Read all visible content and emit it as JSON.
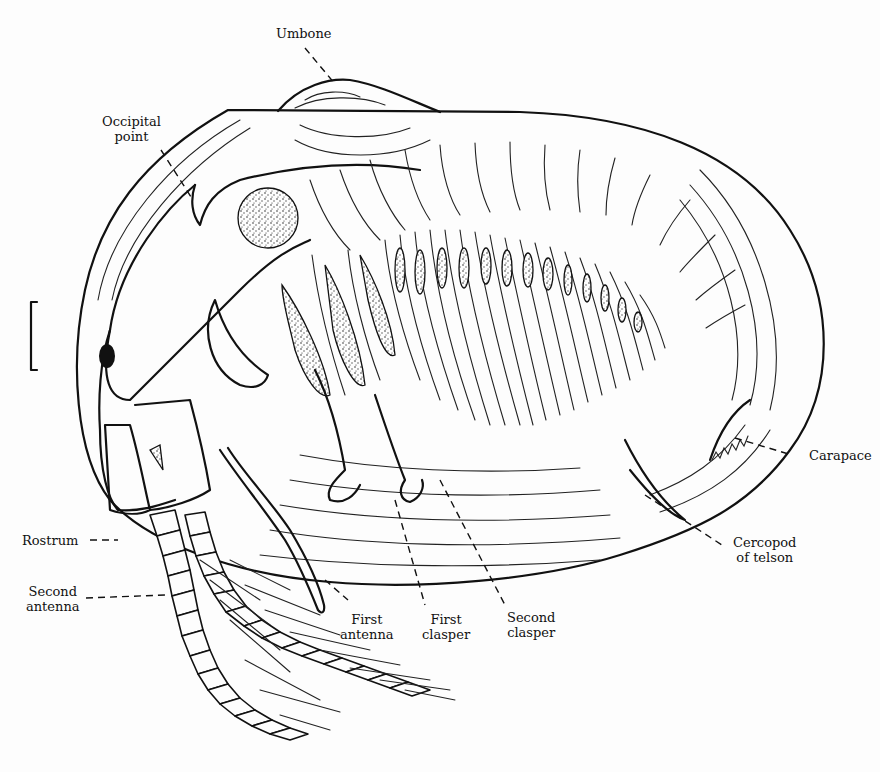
{
  "figure": {
    "labels": {
      "umbone": "Umbone",
      "occipital_point": [
        "Occipital",
        "point"
      ],
      "rostrum": "Rostrum",
      "second_antenna": [
        "Second",
        "antenna"
      ],
      "first_antenna": [
        "First",
        "antenna"
      ],
      "first_clasper": [
        "First",
        "clasper"
      ],
      "second_clasper": [
        "Second",
        "clasper"
      ],
      "carapace": "Carapace",
      "cercopod_of_telson": [
        "Cercopod",
        "of telson"
      ]
    },
    "scale_bar": "bracket",
    "colors": {
      "ink": "#111111",
      "paper": "#fdfdfd"
    }
  }
}
